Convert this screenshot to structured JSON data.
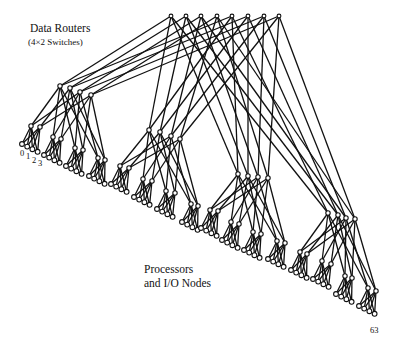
{
  "labels": {
    "routers_title": "Data Routers",
    "routers_subtitle": "(4×2  Switches)",
    "nodes_line1": "Processors",
    "nodes_line2": "and I/O Nodes",
    "leaf_0": "0",
    "leaf_1": "1",
    "leaf_2": "2",
    "leaf_3": "3",
    "leaf_63": "63"
  },
  "colors": {
    "line": "#111111",
    "node_fill": "#ffffff",
    "background": "#ffffff"
  },
  "topology": {
    "type": "fat-tree",
    "levels": [
      "top routers (8)",
      "mid routers (4 groups × 4)",
      "low routers (16 pairs)",
      "processors and I/O nodes (64)"
    ],
    "top": [
      [
        171,
        16
      ],
      [
        186,
        16
      ],
      [
        201,
        16
      ],
      [
        217,
        16
      ],
      [
        232,
        16
      ],
      [
        248,
        16
      ],
      [
        264,
        16
      ],
      [
        279,
        16
      ]
    ],
    "mid": [
      [
        [
          60,
          86
        ],
        [
          70,
          88
        ],
        [
          80,
          92
        ],
        [
          91,
          95
        ]
      ],
      [
        [
          149,
          130
        ],
        [
          160,
          132
        ],
        [
          171,
          136
        ],
        [
          180,
          139
        ]
      ],
      [
        [
          238,
          174
        ],
        [
          248,
          176
        ],
        [
          258,
          177
        ],
        [
          268,
          178
        ]
      ],
      [
        [
          328,
          213
        ],
        [
          338,
          215
        ],
        [
          346,
          218
        ],
        [
          355,
          219
        ]
      ]
    ],
    "low": [
      [
        [
          [
            31,
            126
          ],
          [
            40,
            127
          ]
        ],
        [
          [
            53,
            137
          ],
          [
            61,
            139
          ]
        ],
        [
          [
            75,
            148
          ],
          [
            83,
            150
          ]
        ],
        [
          [
            98,
            158
          ],
          [
            105,
            160
          ]
        ]
      ],
      [
        [
          [
            120,
            166
          ],
          [
            129,
            168
          ]
        ],
        [
          [
            143,
            179
          ],
          [
            152,
            181
          ]
        ],
        [
          [
            166,
            191
          ],
          [
            175,
            193
          ]
        ],
        [
          [
            191,
            204
          ],
          [
            198,
            206
          ]
        ]
      ],
      [
        [
          [
            210,
            210
          ],
          [
            218,
            211
          ]
        ],
        [
          [
            231,
            222
          ],
          [
            239,
            224
          ]
        ],
        [
          [
            253,
            232
          ],
          [
            261,
            234
          ]
        ],
        [
          [
            277,
            241
          ],
          [
            285,
            243
          ]
        ]
      ],
      [
        [
          [
            300,
            252
          ],
          [
            307,
            254
          ]
        ],
        [
          [
            322,
            261
          ],
          [
            331,
            264
          ]
        ],
        [
          [
            345,
            276
          ],
          [
            352,
            278
          ]
        ],
        [
          [
            368,
            288
          ],
          [
            376,
            291
          ]
        ]
      ]
    ]
  }
}
